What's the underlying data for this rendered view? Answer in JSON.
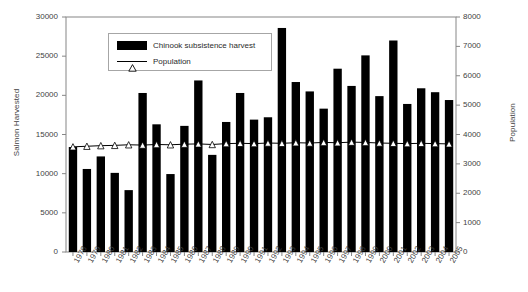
{
  "chart_data": {
    "type": "bar",
    "title": "",
    "xlabel": "",
    "ylabel": "Salmon Harvested",
    "y2label": "Population",
    "ylim": [
      0,
      30000
    ],
    "y2lim": [
      0,
      8000
    ],
    "yticks": [
      "0",
      "5000",
      "10000",
      "15000",
      "20000",
      "25000",
      "30000"
    ],
    "y2ticks": [
      "0",
      "1000",
      "2000",
      "3000",
      "4000",
      "5000",
      "6000",
      "7000",
      "8000"
    ],
    "grid": false,
    "legend_position": "upper-left-inside",
    "categories": [
      "1978",
      "1979",
      "1980",
      "1981",
      "1982",
      "1983",
      "1984",
      "1985",
      "1986",
      "1987",
      "1988",
      "1989",
      "1990",
      "1991",
      "1992",
      "1993",
      "1994",
      "1995",
      "1996",
      "1997",
      "1998",
      "1999",
      "2000",
      "2001",
      "2002",
      "2003",
      "2004",
      "2005"
    ],
    "series": [
      {
        "name": "Chinook subsistence harvest",
        "type": "bar",
        "axis": "left",
        "color": "#000000",
        "values": [
          13400,
          10600,
          12200,
          10100,
          7900,
          20300,
          16300,
          9950,
          16100,
          21900,
          12400,
          16600,
          20300,
          16900,
          17200,
          28600,
          21700,
          20500,
          18300,
          23400,
          21200,
          25100,
          19900,
          27000,
          18900,
          20900,
          20400,
          19400
        ]
      },
      {
        "name": "Population",
        "type": "line",
        "axis": "right",
        "color": "#000000",
        "marker": "triangle",
        "values": [
          3580,
          3600,
          3620,
          3630,
          3650,
          3640,
          3660,
          3650,
          3670,
          3680,
          3660,
          3690,
          3700,
          3690,
          3710,
          3700,
          3720,
          3710,
          3730,
          3720,
          3740,
          3730,
          3710,
          3700,
          3690,
          3700,
          3690,
          3680
        ]
      }
    ]
  },
  "legend": {
    "items": [
      {
        "label": "Chinook subsistence harvest",
        "swatch": "bar-swatch"
      },
      {
        "label": "Population",
        "swatch": "line-swatch"
      }
    ]
  },
  "colors": {
    "bar": "#000000",
    "line": "#000000",
    "axis": "#868686",
    "text": "#3f3f3f",
    "background": "#ffffff",
    "legend_border": "#a6a6a6"
  }
}
